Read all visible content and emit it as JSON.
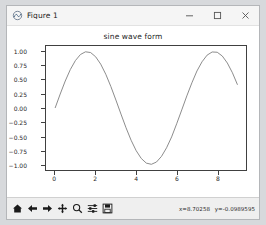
{
  "window": {
    "title": "Figure 1",
    "app_icon": "matplotlib-figure-icon",
    "minimize_label": "—",
    "maximize_label": "□",
    "close_label": "✕"
  },
  "toolbar": {
    "buttons": [
      {
        "name": "home-icon",
        "tooltip": "Home"
      },
      {
        "name": "back-arrow-icon",
        "tooltip": "Back"
      },
      {
        "name": "forward-arrow-icon",
        "tooltip": "Forward"
      },
      {
        "name": "pan-icon",
        "tooltip": "Pan"
      },
      {
        "name": "zoom-icon",
        "tooltip": "Zoom to rectangle"
      },
      {
        "name": "configure-subplots-icon",
        "tooltip": "Configure subplots"
      },
      {
        "name": "save-icon",
        "tooltip": "Save the figure"
      }
    ],
    "cursor_x": "x=8.70258",
    "cursor_y": "y=-0.0989595"
  },
  "chart_data": {
    "type": "line",
    "title": "sine wave form",
    "xlabel": "",
    "ylabel": "",
    "xlim": [
      -0.45,
      9.42
    ],
    "ylim": [
      -1.1,
      1.1
    ],
    "grid": false,
    "legend": null,
    "line_color": "#7f7f7f",
    "xticks": [
      0,
      2,
      4,
      6,
      8
    ],
    "xtick_labels": [
      "0",
      "2",
      "4",
      "6",
      "8"
    ],
    "yticks": [
      -1.0,
      -0.75,
      -0.5,
      -0.25,
      0.0,
      0.25,
      0.5,
      0.75,
      1.0
    ],
    "ytick_labels": [
      "−1.00",
      "−0.75",
      "−0.50",
      "−0.25",
      "0.00",
      "0.25",
      "0.50",
      "0.75",
      "1.00"
    ],
    "series": [
      {
        "name": "sin(x)",
        "x": [
          0.0,
          0.25,
          0.5,
          0.75,
          1.0,
          1.25,
          1.5,
          1.75,
          2.0,
          2.25,
          2.5,
          2.75,
          3.0,
          3.25,
          3.5,
          3.75,
          4.0,
          4.25,
          4.5,
          4.75,
          5.0,
          5.25,
          5.5,
          5.75,
          6.0,
          6.25,
          6.5,
          6.75,
          7.0,
          7.25,
          7.5,
          7.75,
          8.0,
          8.25,
          8.5,
          8.75,
          9.0
        ],
        "y": [
          0.0,
          0.247,
          0.479,
          0.682,
          0.841,
          0.949,
          0.997,
          0.984,
          0.909,
          0.778,
          0.599,
          0.382,
          0.141,
          -0.108,
          -0.351,
          -0.572,
          -0.757,
          -0.895,
          -0.978,
          -0.999,
          -0.959,
          -0.858,
          -0.706,
          -0.513,
          -0.279,
          -0.034,
          0.215,
          0.447,
          0.657,
          0.82,
          0.938,
          0.994,
          0.989,
          0.922,
          0.798,
          0.625,
          0.412
        ]
      }
    ]
  }
}
